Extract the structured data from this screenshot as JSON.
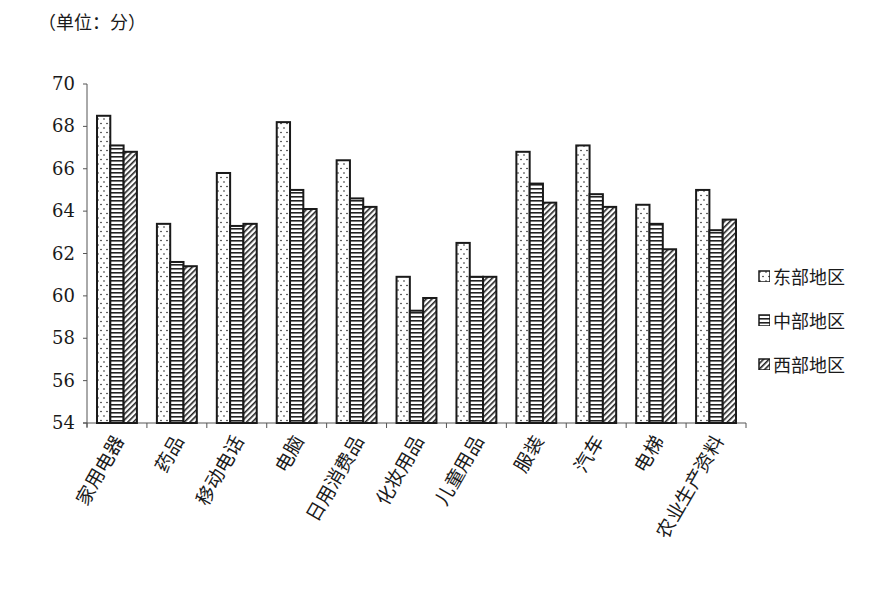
{
  "chart_data": {
    "type": "bar",
    "title": "",
    "unit_label": "（单位：分）",
    "xlabel": "",
    "ylabel": "",
    "ylim": [
      54,
      70
    ],
    "yticks": [
      54,
      56,
      58,
      60,
      62,
      64,
      66,
      68,
      70
    ],
    "grid": false,
    "legend_position": "right",
    "categories": [
      "家用电器",
      "药品",
      "移动电话",
      "电脑",
      "日用消费品",
      "化妆用品",
      "儿童用品",
      "服装",
      "汽车",
      "电梯",
      "农业生产资料"
    ],
    "series": [
      {
        "name": "东部地区",
        "pattern": "dots",
        "values": [
          68.5,
          63.4,
          65.8,
          68.2,
          66.4,
          60.9,
          62.5,
          66.8,
          67.1,
          64.3,
          65.0
        ]
      },
      {
        "name": "中部地区",
        "pattern": "horizontal-lines",
        "values": [
          67.1,
          61.6,
          63.3,
          65.0,
          64.6,
          59.3,
          60.9,
          65.3,
          64.8,
          63.4,
          63.1
        ]
      },
      {
        "name": "西部地区",
        "pattern": "diagonal-lines",
        "values": [
          66.8,
          61.4,
          63.4,
          64.1,
          64.2,
          59.9,
          60.9,
          64.4,
          64.2,
          62.2,
          63.6
        ]
      }
    ]
  },
  "colors": {
    "ink": "#1a1a1a",
    "axis": "#555555",
    "background": "#ffffff"
  }
}
